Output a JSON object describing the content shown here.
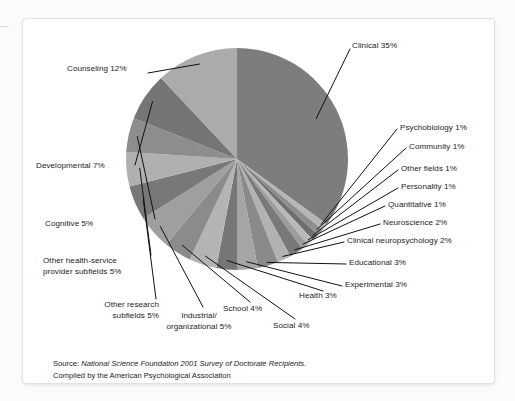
{
  "chart_data": {
    "type": "pie",
    "title": "",
    "subtitle": "",
    "xlabel": "",
    "ylabel": "",
    "legend_position": "none",
    "grid": false,
    "units": "percent",
    "start_angle_deg": 0,
    "direction": "clockwise",
    "categories": [
      "Clinical",
      "Psychobiology",
      "Community",
      "Other fields",
      "Personality",
      "Quantitative",
      "Neuroscience",
      "Clinical neuropsychology",
      "Educational",
      "Experimental",
      "Health",
      "Social",
      "School",
      "Industrial/organizational",
      "Other research subfields",
      "Other health-service provider subfields",
      "Cognitive",
      "Developmental",
      "Counseling"
    ],
    "values": [
      35,
      1,
      1,
      1,
      1,
      1,
      2,
      2,
      3,
      3,
      3,
      4,
      4,
      5,
      5,
      5,
      5,
      7,
      12
    ],
    "colors": [
      "#7d7d7d",
      "#b6b6b6",
      "#8e8e8e",
      "#6e6e6e",
      "#b9b9b9",
      "#9d9d9d",
      "#797979",
      "#b2b2b2",
      "#8a8a8a",
      "#a5a5a5",
      "#767676",
      "#b4b4b4",
      "#8b8b8b",
      "#9f9f9f",
      "#787878",
      "#b0b0b0",
      "#8d8d8d",
      "#757575",
      "#ababab"
    ]
  },
  "chart": {
    "slices": [
      {
        "id": "clinical",
        "label": "Clinical 35%"
      },
      {
        "id": "psychobiology",
        "label": "Psychobiology 1%"
      },
      {
        "id": "community",
        "label": "Community 1%"
      },
      {
        "id": "other-fields",
        "label": "Other fields 1%"
      },
      {
        "id": "personality",
        "label": "Personality 1%"
      },
      {
        "id": "quantitative",
        "label": "Quantitative 1%"
      },
      {
        "id": "neuroscience",
        "label": "Neuroscience 2%"
      },
      {
        "id": "clinical-neuro",
        "label": "Clinical neuropsychology 2%"
      },
      {
        "id": "educational",
        "label": "Educational 3%"
      },
      {
        "id": "experimental",
        "label": "Experimental 3%"
      },
      {
        "id": "health",
        "label": "Health 3%"
      },
      {
        "id": "social",
        "label": "Social 4%"
      },
      {
        "id": "school",
        "label": "School 4%"
      },
      {
        "id": "industrial",
        "label": "Industrial/\norganizational 5%"
      },
      {
        "id": "other-research",
        "label": "Other research\nsubfields 5%"
      },
      {
        "id": "other-health",
        "label": "Other health-service\nprovider subfields 5%"
      },
      {
        "id": "cognitive",
        "label": "Cognitive 5%"
      },
      {
        "id": "developmental",
        "label": "Developmental 7%"
      },
      {
        "id": "counseling",
        "label": "Counseling 12%"
      }
    ]
  },
  "source": {
    "prefix": "Source: ",
    "italic": "National Science Foundation 2001 Survey of Doctorate Recipients.",
    "line2": "Compiled by the American Psychological Association"
  }
}
